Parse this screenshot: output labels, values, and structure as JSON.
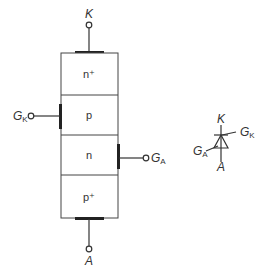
{
  "diagram": {
    "terminals": {
      "cathode": "K",
      "anode": "A",
      "gate_k": "G",
      "gate_k_sub": "K",
      "gate_a": "G",
      "gate_a_sub": "A"
    },
    "layers": [
      "n⁺",
      "p",
      "n",
      "p⁺"
    ],
    "symbol": {
      "cathode": "K",
      "anode": "A",
      "gate_k": "G",
      "gate_k_sub": "K",
      "gate_a": "G",
      "gate_a_sub": "A"
    },
    "colors": {
      "line": "#333333",
      "background": "#ffffff"
    }
  }
}
